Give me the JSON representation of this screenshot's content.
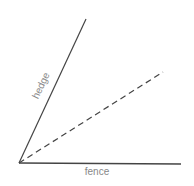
{
  "diagram": {
    "type": "angle",
    "vertex": [
      19,
      163
    ],
    "lines": [
      {
        "name": "hedge",
        "label": "hedge",
        "style": "solid",
        "end": [
          86,
          19
        ],
        "color": "#444444"
      },
      {
        "name": "bisector",
        "label": "",
        "style": "dashed",
        "end": [
          163,
          72
        ],
        "color": "#444444"
      },
      {
        "name": "fence",
        "label": "fence",
        "style": "solid",
        "end": [
          181,
          164
        ],
        "color": "#444444"
      }
    ],
    "labels": {
      "hedge": "hedge",
      "fence": "fence"
    }
  }
}
